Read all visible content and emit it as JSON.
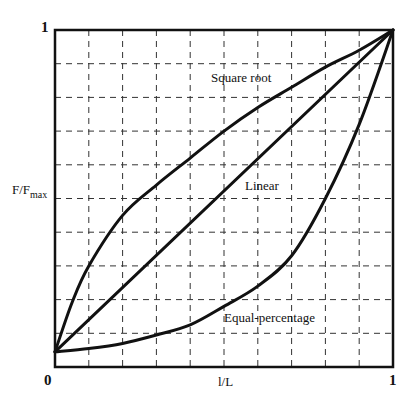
{
  "chart_data": {
    "type": "line",
    "title": "",
    "xlabel": "l/L",
    "ylabel_main": "F/F",
    "ylabel_sub": "max",
    "xlim": [
      0,
      1
    ],
    "ylim": [
      0,
      1
    ],
    "grid": true,
    "grid_style": "dashed",
    "grid_divisions": 10,
    "x_ticks": [
      "0",
      "1"
    ],
    "y_ticks": [
      "1"
    ],
    "legend": "inline annotations",
    "series": [
      {
        "name": "Square root",
        "x": [
          0,
          0.05,
          0.1,
          0.2,
          0.3,
          0.4,
          0.5,
          0.6,
          0.7,
          0.8,
          0.9,
          1.0
        ],
        "y": [
          0.045,
          0.19,
          0.3,
          0.45,
          0.54,
          0.62,
          0.7,
          0.77,
          0.83,
          0.89,
          0.94,
          1.0
        ]
      },
      {
        "name": "Linear",
        "x": [
          0,
          1.0
        ],
        "y": [
          0.045,
          1.0
        ]
      },
      {
        "name": "Equal-percentage",
        "x": [
          0,
          0.1,
          0.2,
          0.3,
          0.4,
          0.5,
          0.6,
          0.7,
          0.8,
          0.9,
          1.0
        ],
        "y": [
          0.045,
          0.055,
          0.07,
          0.095,
          0.125,
          0.18,
          0.24,
          0.33,
          0.5,
          0.72,
          1.0
        ]
      }
    ],
    "annotations": [
      {
        "text": "Square root",
        "x": 0.52,
        "y": 0.86
      },
      {
        "text": "Linear",
        "x": 0.54,
        "y": 0.52
      },
      {
        "text": "Equal-percentage",
        "x": 0.52,
        "y": 0.14
      }
    ]
  },
  "labels": {
    "y_top": "1",
    "x_origin": "0",
    "x_right": "1",
    "x_title": "l/L",
    "y_title": "F/F",
    "y_title_sub": "max",
    "ann_sqrt": "Square root",
    "ann_linear": "Linear",
    "ann_eqp": "Equal-percentage"
  }
}
